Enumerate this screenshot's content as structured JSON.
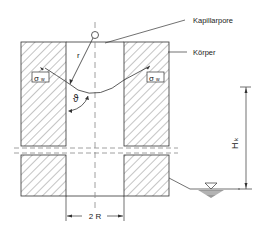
{
  "diagram": {
    "type": "capillary-rise-cross-section",
    "labels": {
      "capillary_pore": "Kapillarpore",
      "body": "Körper",
      "radius": "r",
      "angle": "ϑ",
      "surface_tension_left": "σ",
      "surface_tension_left_sub": "w",
      "surface_tension_right": "σ",
      "surface_tension_right_sub": "w",
      "height": "H",
      "height_sub": "k",
      "width": "2 R"
    },
    "icons": {
      "water_level": "inverted-triangle-water-level-icon"
    },
    "colors": {
      "line": "#333333",
      "hatch": "#555555",
      "text": "#222222",
      "water": "#9a9a9a",
      "dash": "#888888"
    }
  }
}
